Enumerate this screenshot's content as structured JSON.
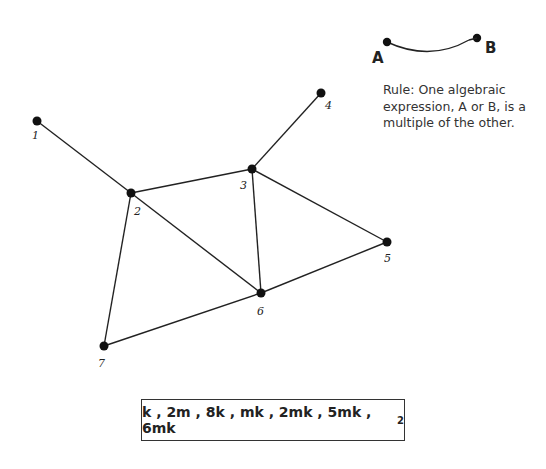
{
  "legend": {
    "endpoint_a": "A",
    "endpoint_b": "B",
    "rule_text": "Rule: One algebraic expression, A or B, is a multiple of the other."
  },
  "graph": {
    "nodes": [
      {
        "id": "1",
        "x": 37,
        "y": 121
      },
      {
        "id": "2",
        "x": 131,
        "y": 193
      },
      {
        "id": "3",
        "x": 252,
        "y": 169
      },
      {
        "id": "4",
        "x": 321,
        "y": 93
      },
      {
        "id": "5",
        "x": 387,
        "y": 242
      },
      {
        "id": "6",
        "x": 261,
        "y": 293
      },
      {
        "id": "7",
        "x": 104,
        "y": 346
      }
    ],
    "edges": [
      [
        "1",
        "2"
      ],
      [
        "2",
        "3"
      ],
      [
        "3",
        "4"
      ],
      [
        "2",
        "6"
      ],
      [
        "3",
        "6"
      ],
      [
        "3",
        "5"
      ],
      [
        "5",
        "6"
      ],
      [
        "2",
        "7"
      ],
      [
        "6",
        "7"
      ]
    ]
  },
  "expressions": {
    "text": "k , 2m , 8k , mk , 2mk , 5mk , 6mk",
    "last_exponent": "2"
  }
}
